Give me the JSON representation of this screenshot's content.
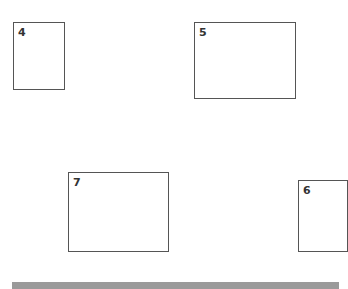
{
  "boxes": [
    {
      "id": "4",
      "label": "4"
    },
    {
      "id": "5",
      "label": "5"
    },
    {
      "id": "7",
      "label": "7"
    },
    {
      "id": "6",
      "label": "6"
    }
  ],
  "colors": {
    "border": "#555555",
    "bar": "#9a9a9a"
  }
}
